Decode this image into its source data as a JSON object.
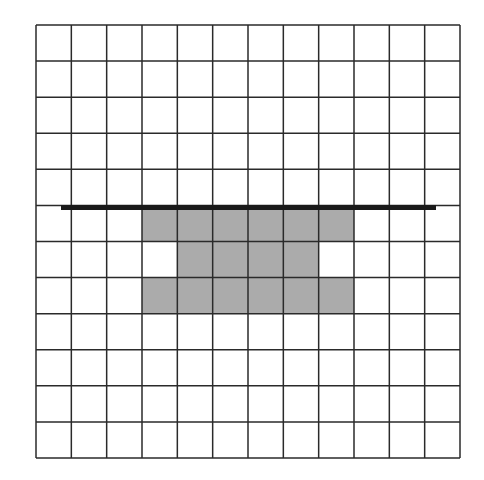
{
  "grid": {
    "cols": 12,
    "rows": 12,
    "left": 36,
    "top": 25,
    "width": 424,
    "height": 433,
    "line_color": "#2a2a2a",
    "background": "#ffffff"
  },
  "shaded_cells": {
    "color": "#ababab",
    "cells": [
      [
        5,
        3
      ],
      [
        5,
        4
      ],
      [
        5,
        5
      ],
      [
        5,
        6
      ],
      [
        5,
        7
      ],
      [
        5,
        8
      ],
      [
        6,
        4
      ],
      [
        6,
        5
      ],
      [
        6,
        6
      ],
      [
        6,
        7
      ],
      [
        7,
        3
      ],
      [
        7,
        4
      ],
      [
        7,
        5
      ],
      [
        7,
        6
      ],
      [
        7,
        7
      ],
      [
        7,
        8
      ]
    ]
  },
  "thick_line": {
    "x1": 61,
    "x2": 436,
    "y": 207.5,
    "width": 5,
    "color": "#1a1a1a"
  }
}
